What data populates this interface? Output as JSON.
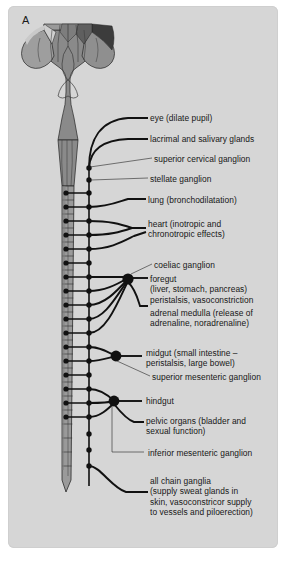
{
  "figure": {
    "panel_letter": "A",
    "caption": "",
    "colors": {
      "page_background": "#ffffff",
      "panel_background": "#d6d6d6",
      "cord_fill": "#8c8c8c",
      "cord_fill_dark": "#6f6f6f",
      "cord_fill_darkest": "#4a4a4a",
      "cord_fill_light": "#b4b4b4",
      "outline": "#1a1a1a",
      "nerve_line": "#111111",
      "text": "#161616"
    }
  },
  "labels": [
    {
      "id": "eye",
      "text": "eye (dilate pupil)"
    },
    {
      "id": "lacrimal-salivary",
      "text": "lacrimal and salivary glands"
    },
    {
      "id": "superior-cervical-ganglion",
      "text": "superior cervical ganglion"
    },
    {
      "id": "stellate-ganglion",
      "text": "stellate ganglion"
    },
    {
      "id": "lung",
      "text": "lung (bronchodilatation)"
    },
    {
      "id": "heart",
      "text": "heart (inotropic and\nchronotropic effects)"
    },
    {
      "id": "coeliac-ganglion",
      "text": "coeliac ganglion"
    },
    {
      "id": "foregut",
      "text": "foregut\n(liver, stomach, pancreas)\nperistalsis, vasoconstriction"
    },
    {
      "id": "adrenal-medulla",
      "text": "adrenal medulla (release of\nadrenaline, noradrenaline)"
    },
    {
      "id": "midgut",
      "text": "midgut (small intestine –\nperistalsis, large bowel)"
    },
    {
      "id": "superior-mesenteric-ganglion",
      "text": "superior mesenteric ganglion"
    },
    {
      "id": "hindgut",
      "text": "hindgut"
    },
    {
      "id": "pelvic-organs",
      "text": "pelvic organs (bladder and\nsexual function)"
    },
    {
      "id": "inferior-mesenteric-ganglion",
      "text": "inferior mesenteric ganglion"
    },
    {
      "id": "all-chain-ganglia",
      "text": "all chain ganglia\n(supply sweat glands in\nskin, vasoconstricor supply\nto vessels and piloerection)"
    }
  ],
  "anatomy": {
    "structures": [
      {
        "id": "brainstem",
        "name": "brainstem / medulla"
      },
      {
        "id": "spinal-cord",
        "name": "spinal cord"
      },
      {
        "id": "thoracolumbar",
        "name": "thoracolumbar segments T1–L2"
      },
      {
        "id": "conus-medullaris",
        "name": "conus medullaris"
      },
      {
        "id": "sympathetic-chain",
        "name": "sympathetic chain"
      }
    ],
    "lateral_horn_dot_count": 14,
    "chain_ganglion_dot_count": 19,
    "prevertebral_ganglia": [
      {
        "id": "coeliac-ganglion",
        "name": "coeliac ganglion"
      },
      {
        "id": "superior-mesenteric-ganglion",
        "name": "superior mesenteric ganglion"
      },
      {
        "id": "inferior-mesenteric-ganglion",
        "name": "inferior mesenteric ganglion"
      }
    ]
  }
}
